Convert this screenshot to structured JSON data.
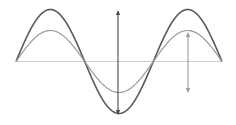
{
  "diagram": {
    "title": "",
    "axis": {
      "x1": 16,
      "x2": 222,
      "y": 61.5,
      "color": "#cfcfcf"
    },
    "waves": [
      {
        "name": "large-amplitude-wave",
        "amplitude": 52,
        "color": "#5a5a5a",
        "width": 1.6
      },
      {
        "name": "small-amplitude-wave",
        "amplitude": 31,
        "color": "#9a9a9a",
        "width": 1.2
      }
    ],
    "wave_geometry": {
      "x_start": 16,
      "x_end": 222,
      "periods": 1.5,
      "baseline_y": 61.5
    },
    "arrows": [
      {
        "name": "large-amplitude-arrow",
        "x": 118,
        "y1": 10,
        "y2": 115,
        "color": "#4a4a4a"
      },
      {
        "name": "small-amplitude-arrow",
        "x": 188,
        "y1": 32,
        "y2": 93,
        "color": "#9a9a9a"
      }
    ]
  }
}
